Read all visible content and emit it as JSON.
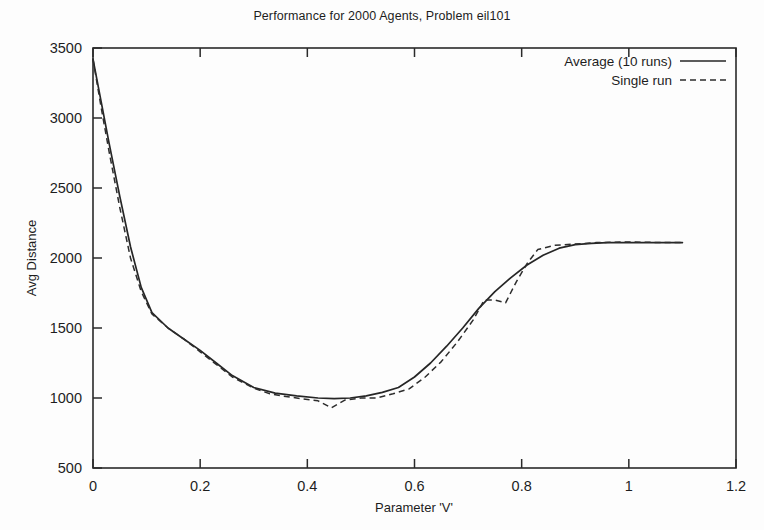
{
  "chart_data": {
    "type": "line",
    "title": "Performance for 2000 Agents, Problem eil101",
    "xlabel": "Parameter 'V'",
    "ylabel": "Avg Distance",
    "xlim": [
      0,
      1.2
    ],
    "ylim": [
      500,
      3500
    ],
    "xticks": [
      "0",
      "0.2",
      "0.4",
      "0.6",
      "0.8",
      "1",
      "1.2"
    ],
    "xtick_values": [
      0,
      0.2,
      0.4,
      0.6,
      0.8,
      1,
      1.2
    ],
    "yticks": [
      "500",
      "1000",
      "1500",
      "2000",
      "2500",
      "3000",
      "3500"
    ],
    "ytick_values": [
      500,
      1000,
      1500,
      2000,
      2500,
      3000,
      3500
    ],
    "grid": false,
    "legend_position": "top-right",
    "line_color": "#262626",
    "series": [
      {
        "name": "Average (10 runs)",
        "style": "solid",
        "x": [
          0.0,
          0.015,
          0.03,
          0.05,
          0.07,
          0.09,
          0.11,
          0.14,
          0.17,
          0.2,
          0.23,
          0.26,
          0.3,
          0.34,
          0.38,
          0.42,
          0.45,
          0.48,
          0.51,
          0.54,
          0.57,
          0.6,
          0.63,
          0.66,
          0.69,
          0.72,
          0.75,
          0.78,
          0.81,
          0.84,
          0.87,
          0.9,
          0.93,
          0.96,
          1.0,
          1.04,
          1.1
        ],
        "y": [
          3420,
          3120,
          2820,
          2440,
          2080,
          1790,
          1610,
          1500,
          1420,
          1340,
          1250,
          1160,
          1075,
          1035,
          1015,
          1000,
          995,
          1000,
          1015,
          1040,
          1075,
          1150,
          1250,
          1370,
          1500,
          1640,
          1760,
          1860,
          1950,
          2020,
          2070,
          2095,
          2105,
          2110,
          2110,
          2110,
          2110
        ]
      },
      {
        "name": "Single run",
        "style": "dashed",
        "x": [
          0.0,
          0.015,
          0.03,
          0.05,
          0.07,
          0.09,
          0.11,
          0.14,
          0.17,
          0.2,
          0.23,
          0.26,
          0.3,
          0.33,
          0.36,
          0.39,
          0.42,
          0.445,
          0.47,
          0.5,
          0.53,
          0.56,
          0.59,
          0.62,
          0.65,
          0.68,
          0.71,
          0.73,
          0.75,
          0.77,
          0.79,
          0.81,
          0.83,
          0.86,
          0.9,
          0.94,
          1.0,
          1.06,
          1.1
        ],
        "y": [
          3420,
          3080,
          2760,
          2360,
          2000,
          1760,
          1600,
          1500,
          1420,
          1330,
          1240,
          1150,
          1070,
          1030,
          1010,
          995,
          980,
          930,
          985,
          1000,
          1000,
          1030,
          1065,
          1150,
          1260,
          1400,
          1560,
          1700,
          1700,
          1680,
          1830,
          1960,
          2060,
          2090,
          2100,
          2110,
          2115,
          2110,
          2110
        ]
      }
    ]
  },
  "legend": {
    "entries": [
      {
        "label": "Average (10 runs)",
        "style": "solid"
      },
      {
        "label": "Single run",
        "style": "dashed"
      }
    ]
  },
  "axes": {
    "y_title": "Avg Distance",
    "x_title": "Parameter 'V'"
  }
}
